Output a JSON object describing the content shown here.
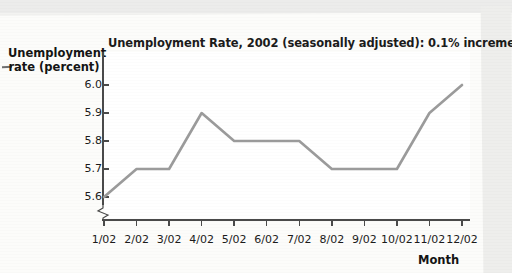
{
  "chart_data": {
    "type": "line",
    "title": "Unemployment Rate, 2002 (seasonally adjusted): 0.1% increments",
    "xlabel": "Month",
    "ylabel": "Unemployment rate (percent)",
    "categories": [
      "1/02",
      "2/02",
      "3/02",
      "4/02",
      "5/02",
      "6/02",
      "7/02",
      "8/02",
      "9/02",
      "10/02",
      "11/02",
      "12/02"
    ],
    "values": [
      5.6,
      5.7,
      5.7,
      5.9,
      5.8,
      5.8,
      5.8,
      5.7,
      5.7,
      5.7,
      5.9,
      6.0
    ],
    "ytick_labels": [
      "6.0",
      "5.9",
      "5.8",
      "5.7",
      "5.6"
    ],
    "ytick_values": [
      6.0,
      5.9,
      5.8,
      5.7,
      5.6
    ],
    "ylim": [
      5.55,
      6.03
    ],
    "xlim": [
      "1/02",
      "12/02"
    ],
    "grid": false,
    "legend": null,
    "series_color": "#9b9b9b",
    "axis_color": "#4a4a4a",
    "axis_break": true,
    "increment_note": "0.1% increments"
  },
  "axes": {
    "y_axis_title_line1": "Unemployment",
    "y_axis_title_line2": "rate (percent)",
    "x_axis_title": "Month"
  }
}
